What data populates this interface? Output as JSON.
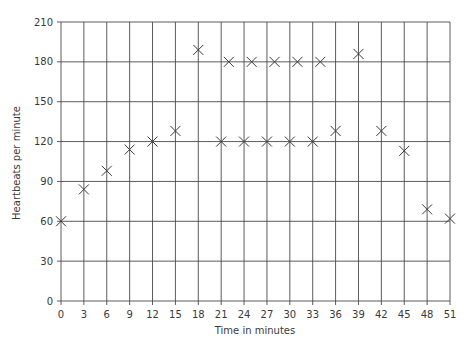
{
  "chart_data": {
    "type": "scatter",
    "title": "",
    "xlabel": "Time in minutes",
    "ylabel": "Heartbeats per minute",
    "xlim": [
      0,
      51
    ],
    "ylim": [
      0,
      210
    ],
    "x_ticks": [
      0,
      3,
      6,
      9,
      12,
      15,
      18,
      21,
      24,
      27,
      30,
      33,
      36,
      39,
      42,
      45,
      48,
      51
    ],
    "y_ticks": [
      0,
      30,
      60,
      90,
      120,
      150,
      180,
      210
    ],
    "grid": true,
    "marker": "x",
    "legend": null,
    "series": [
      {
        "name": "Heartbeats",
        "points": [
          {
            "x": 0,
            "y": 60
          },
          {
            "x": 3,
            "y": 84
          },
          {
            "x": 6,
            "y": 98
          },
          {
            "x": 9,
            "y": 114
          },
          {
            "x": 12,
            "y": 120
          },
          {
            "x": 15,
            "y": 128
          },
          {
            "x": 18,
            "y": 189
          },
          {
            "x": 21,
            "y": 120
          },
          {
            "x": 22,
            "y": 180
          },
          {
            "x": 24,
            "y": 120
          },
          {
            "x": 25,
            "y": 180
          },
          {
            "x": 27,
            "y": 120
          },
          {
            "x": 28,
            "y": 180
          },
          {
            "x": 30,
            "y": 120
          },
          {
            "x": 31,
            "y": 180
          },
          {
            "x": 33,
            "y": 120
          },
          {
            "x": 34,
            "y": 180
          },
          {
            "x": 36,
            "y": 128
          },
          {
            "x": 39,
            "y": 186
          },
          {
            "x": 42,
            "y": 128
          },
          {
            "x": 45,
            "y": 113
          },
          {
            "x": 48,
            "y": 69
          },
          {
            "x": 51,
            "y": 62
          }
        ]
      }
    ]
  },
  "colors": {
    "grid": "#4a4a4a",
    "marker": "#3a3a3a",
    "text": "#3a3a3a"
  }
}
